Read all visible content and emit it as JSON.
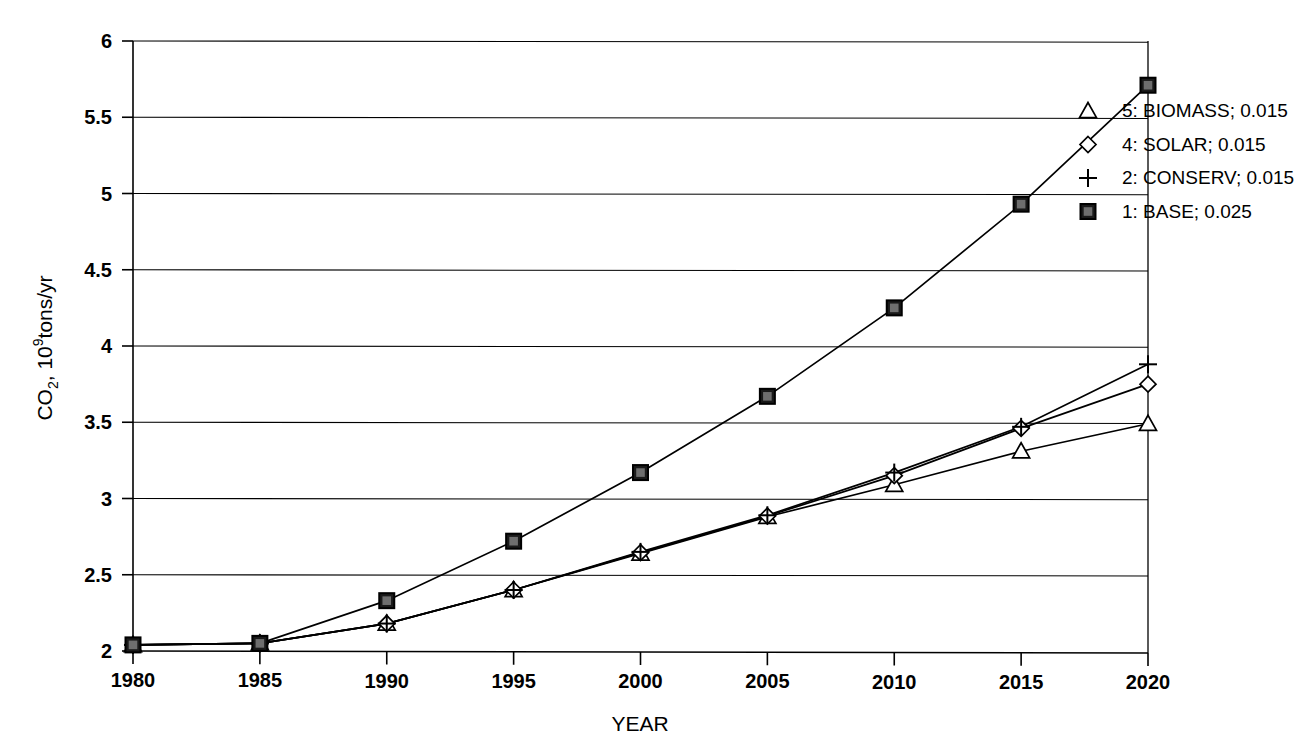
{
  "chart_data": {
    "type": "line",
    "title": "",
    "xlabel": "YEAR",
    "ylabel": "CO2, 10^9 tons/yr",
    "ylabel_parts": {
      "main_1": "CO",
      "sub_1": "2",
      "main_2": ", 10",
      "sup_1": "9",
      "main_3": "tons/yr"
    },
    "x": [
      1980,
      1985,
      1990,
      1995,
      2000,
      2005,
      2010,
      2015,
      2020
    ],
    "xtick_labels": [
      "1980",
      "1985",
      "1990",
      "1995",
      "2000",
      "2005",
      "2010",
      "2015",
      "2020"
    ],
    "ytick_labels": [
      "2",
      "2.5",
      "3",
      "3.5",
      "4",
      "4.5",
      "5",
      "5.5",
      "6"
    ],
    "ytick_values": [
      2,
      2.5,
      3,
      3.5,
      4,
      4.5,
      5,
      5.5,
      6
    ],
    "xlim": [
      1980,
      2020
    ],
    "ylim": [
      2,
      6
    ],
    "grid": "horizontal",
    "legend_position": "right",
    "series": [
      {
        "name": "5: BIOMASS; 0.015",
        "key": "biomass",
        "marker": "triangle-up-open",
        "growth_rate": 0.015,
        "scenario_number": 5,
        "scenario_name": "BIOMASS",
        "values": [
          2.04,
          2.05,
          2.18,
          2.4,
          2.64,
          2.88,
          3.09,
          3.31,
          3.49
        ]
      },
      {
        "name": "4: SOLAR; 0.015",
        "key": "solar",
        "marker": "diamond-open",
        "growth_rate": 0.015,
        "scenario_number": 4,
        "scenario_name": "SOLAR",
        "values": [
          2.04,
          2.05,
          2.18,
          2.4,
          2.645,
          2.885,
          3.15,
          3.46,
          3.75
        ]
      },
      {
        "name": "2: CONSERV; 0.015",
        "key": "conserv",
        "marker": "plus",
        "growth_rate": 0.015,
        "scenario_number": 2,
        "scenario_name": "CONSERV",
        "values": [
          2.04,
          2.05,
          2.18,
          2.4,
          2.65,
          2.89,
          3.17,
          3.47,
          3.88
        ]
      },
      {
        "name": "1: BASE; 0.025",
        "key": "base",
        "marker": "square-filled",
        "growth_rate": 0.025,
        "scenario_number": 1,
        "scenario_name": "BASE",
        "values": [
          2.04,
          2.05,
          2.33,
          2.72,
          3.17,
          3.67,
          4.25,
          4.93,
          5.71
        ]
      }
    ]
  },
  "legend": {
    "entries": [
      {
        "marker": "triangle-up-open",
        "label": "5: BIOMASS; 0.015"
      },
      {
        "marker": "diamond-open",
        "label": "4: SOLAR; 0.015"
      },
      {
        "marker": "plus",
        "label": "2: CONSERV; 0.015"
      },
      {
        "marker": "square-filled",
        "label": "1: BASE; 0.025"
      }
    ]
  },
  "colors": {
    "line": "#000000",
    "grid": "#000000",
    "axis": "#000000",
    "background": "#ffffff",
    "marker_fill": "#ffffff",
    "marker_fill_solid": "#1a1a1a"
  }
}
